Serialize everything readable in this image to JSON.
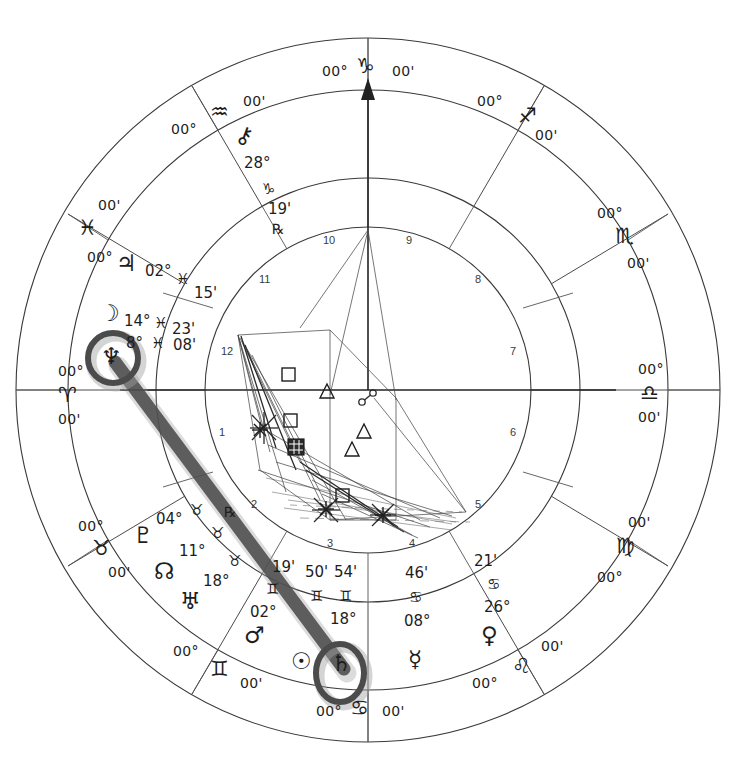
{
  "chart": {
    "type": "astrological-natal-wheel",
    "width": 737,
    "height": 770,
    "center": {
      "x": 368,
      "y": 390
    },
    "radii": {
      "outer_ring_outer": 352,
      "outer_ring_inner": 300,
      "sign_band_inner": 212,
      "house_ring_outer": 212,
      "house_ring_inner": 163,
      "aspect_circle": 163
    },
    "colors": {
      "line": "#3a3a3a",
      "text": "#1d1d1d",
      "highlight": "#4b4b4b",
      "highlight_shadow": "#9a9a9a",
      "background": "#ffffff"
    }
  },
  "angles": {
    "ascendant": {
      "label": "Ascendant",
      "degree": "00°",
      "sign": "♈",
      "sign_name": "Aries",
      "minute": "00'"
    },
    "midheaven": {
      "label": "Midheaven",
      "degree": "00°",
      "sign": "♑",
      "sign_name": "Capricorn",
      "minute": "00'"
    },
    "descendant": {
      "label": "Descendant",
      "degree": "00°",
      "sign": "♎",
      "sign_name": "Libra",
      "minute": "00'"
    },
    "imum_coeli": {
      "label": "Imum Coeli",
      "degree": "00°",
      "sign": "♋",
      "sign_name": "Cancer",
      "minute": "00'"
    }
  },
  "sign_cusps": [
    {
      "name": "Aries",
      "glyph": "♈",
      "degree": "00°",
      "minute": "00'",
      "x": 66,
      "y": 372,
      "glyph_x": 62,
      "glyph_y": 390,
      "min_x": 64,
      "min_y": 412,
      "rot": 0
    },
    {
      "name": "Taurus",
      "glyph": "♉",
      "degree": "00°",
      "minute": "00'",
      "x": 83,
      "y": 524,
      "glyph_x": 96,
      "glyph_y": 547,
      "min_x": 110,
      "min_y": 572,
      "rot": -30
    },
    {
      "name": "Gemini",
      "glyph": "♊",
      "degree": "00°",
      "minute": "00'",
      "x": 180,
      "y": 650,
      "glyph_x": 215,
      "glyph_y": 668,
      "min_x": 243,
      "min_y": 682,
      "rot": -60
    },
    {
      "name": "Cancer",
      "glyph": "♋",
      "degree": "00°",
      "minute": "00'",
      "x": 322,
      "y": 712,
      "glyph_x": 358,
      "glyph_y": 710,
      "min_x": 388,
      "min_y": 712,
      "rot": 0
    },
    {
      "name": "Leo",
      "glyph": "♌",
      "degree": "00°",
      "minute": "00'",
      "x": 480,
      "y": 684,
      "glyph_x": 520,
      "glyph_y": 668,
      "min_x": 545,
      "min_y": 645,
      "rot": 60
    },
    {
      "name": "Virgo",
      "glyph": "♍",
      "degree": "00°",
      "minute": "00'",
      "x": 604,
      "y": 578,
      "glyph_x": 622,
      "glyph_y": 545,
      "min_x": 633,
      "min_y": 522,
      "rot": 30
    },
    {
      "name": "Libra",
      "glyph": "♎",
      "degree": "00°",
      "minute": "00'",
      "x": 645,
      "y": 370,
      "glyph_x": 648,
      "glyph_y": 392,
      "min_x": 645,
      "min_y": 414,
      "rot": 0
    },
    {
      "name": "Scorpio",
      "glyph": "♏",
      "degree": "00°",
      "minute": "00'",
      "x": 604,
      "y": 212,
      "glyph_x": 622,
      "glyph_y": 236,
      "min_x": 632,
      "min_y": 262,
      "rot": -30
    },
    {
      "name": "Sagittarius",
      "glyph": "♐",
      "degree": "00°",
      "minute": "00'",
      "x": 484,
      "y": 100,
      "glyph_x": 524,
      "glyph_y": 118,
      "min_x": 540,
      "min_y": 134,
      "rot": -60
    },
    {
      "name": "Capricorn",
      "glyph": "♑",
      "degree": "00°",
      "minute": "00'",
      "x": 328,
      "y": 72,
      "glyph_x": 364,
      "glyph_y": 68,
      "min_x": 398,
      "min_y": 72,
      "rot": 0
    },
    {
      "name": "Aquarius",
      "glyph": "♒",
      "degree": "00°",
      "minute": "00'",
      "x": 178,
      "y": 128,
      "glyph_x": 218,
      "glyph_y": 113,
      "min_x": 248,
      "min_y": 100,
      "rot": 60
    },
    {
      "name": "Pisces",
      "glyph": "♓",
      "degree": "00°",
      "minute": "00'",
      "x": 94,
      "y": 256,
      "glyph_x": 84,
      "glyph_y": 228,
      "min_x": 104,
      "min_y": 205,
      "rot": 30
    }
  ],
  "houses": [
    {
      "num": "1",
      "x": 222,
      "y": 432
    },
    {
      "num": "2",
      "x": 254,
      "y": 504
    },
    {
      "num": "3",
      "x": 330,
      "y": 543
    },
    {
      "num": "4",
      "x": 412,
      "y": 543
    },
    {
      "num": "5",
      "x": 478,
      "y": 504
    },
    {
      "num": "6",
      "x": 513,
      "y": 432
    },
    {
      "num": "7",
      "x": 513,
      "y": 351
    },
    {
      "num": "8",
      "x": 478,
      "y": 279
    },
    {
      "num": "9",
      "x": 409,
      "y": 240
    },
    {
      "num": "10",
      "x": 328,
      "y": 240
    },
    {
      "num": "11",
      "x": 262,
      "y": 279
    },
    {
      "num": "12",
      "x": 224,
      "y": 351
    }
  ],
  "planets": [
    {
      "id": "chiron",
      "name": "Chiron",
      "glyph": "⚷",
      "degree": "28°",
      "sign": "♑",
      "sign_name": "Capricorn",
      "minute": "19'",
      "retrograde": "℞",
      "glyph_x": 241,
      "glyph_y": 133,
      "deg_x": 248,
      "deg_y": 162,
      "sign_x": 266,
      "sign_y": 188,
      "min_x": 272,
      "min_y": 208,
      "rx_x": 276,
      "rx_y": 228,
      "highlighted": false
    },
    {
      "id": "jupiter",
      "name": "Jupiter",
      "glyph": "♃",
      "degree": "02°",
      "sign": "♓",
      "sign_name": "Pisces",
      "minute": "15'",
      "retrograde": "",
      "glyph_x": 122,
      "glyph_y": 262,
      "deg_x": 150,
      "deg_y": 272,
      "sign_x": 182,
      "sign_y": 281,
      "min_x": 196,
      "min_y": 293,
      "rx_x": 0,
      "rx_y": 0,
      "highlighted": false
    },
    {
      "id": "moon",
      "name": "Moon",
      "glyph": "☽",
      "degree": "14°",
      "sign": "♓",
      "sign_name": "Pisces",
      "minute": "23'",
      "retrograde": "",
      "glyph_x": 104,
      "glyph_y": 310,
      "deg_x": 129,
      "deg_y": 322,
      "sign_x": 158,
      "sign_y": 324,
      "min_x": 175,
      "min_y": 330,
      "rx_x": 0,
      "rx_y": 0,
      "highlighted": false
    },
    {
      "id": "neptune",
      "name": "Neptune",
      "glyph": "♆",
      "degree": "8°",
      "sign": "♓",
      "sign_name": "Pisces",
      "minute": "08'",
      "retrograde": "",
      "glyph_x": 96,
      "glyph_y": 343,
      "deg_x": 130,
      "deg_y": 342,
      "sign_x": 155,
      "sign_y": 344,
      "min_x": 176,
      "min_y": 345,
      "rx_x": 0,
      "rx_y": 0,
      "highlighted": true
    },
    {
      "id": "pluto",
      "name": "Pluto",
      "glyph": "♇",
      "degree": "04°",
      "sign": "♉",
      "sign_name": "Taurus",
      "minute": "",
      "retrograde": "",
      "glyph_x": 139,
      "glyph_y": 534,
      "deg_x": 160,
      "deg_y": 520,
      "sign_x": 194,
      "sign_y": 512,
      "min_x": 0,
      "min_y": 0,
      "rx_x": 0,
      "rx_y": 0,
      "highlighted": false
    },
    {
      "id": "north-node",
      "name": "North Node",
      "glyph": "☊",
      "degree": "11°",
      "sign": "♉",
      "sign_name": "Taurus",
      "minute": "",
      "retrograde": "℞",
      "glyph_x": 160,
      "glyph_y": 570,
      "deg_x": 183,
      "deg_y": 552,
      "sign_x": 214,
      "sign_y": 535,
      "min_x": 0,
      "min_y": 0,
      "rx_x": 228,
      "rx_y": 513,
      "highlighted": false
    },
    {
      "id": "uranus",
      "name": "Uranus",
      "glyph": "♅",
      "degree": "18°",
      "sign": "♉",
      "sign_name": "Taurus",
      "minute": "",
      "retrograde": "",
      "glyph_x": 186,
      "glyph_y": 600,
      "deg_x": 207,
      "deg_y": 582,
      "sign_x": 231,
      "sign_y": 563,
      "min_x": 0,
      "min_y": 0,
      "rx_x": 0,
      "rx_y": 0,
      "highlighted": false
    },
    {
      "id": "mars",
      "name": "Mars",
      "glyph": "♂",
      "degree": "02°",
      "sign": "♊",
      "sign_name": "Gemini",
      "minute": "19'",
      "retrograde": "",
      "glyph_x": 250,
      "glyph_y": 634,
      "deg_x": 254,
      "deg_y": 613,
      "sign_x": 268,
      "sign_y": 591,
      "min_x": 276,
      "min_y": 568,
      "rx_x": 0,
      "rx_y": 0,
      "highlighted": false
    },
    {
      "id": "sun",
      "name": "Sun",
      "glyph": "☉",
      "degree": "",
      "sign": "♊",
      "sign_name": "Gemini",
      "minute": "50'",
      "retrograde": "",
      "glyph_x": 298,
      "glyph_y": 660,
      "deg_x": 305,
      "deg_y": 620,
      "sign_x": 314,
      "sign_y": 597,
      "min_x": 311,
      "min_y": 573,
      "rx_x": 0,
      "rx_y": 0,
      "highlighted": false
    },
    {
      "id": "saturn",
      "name": "Saturn",
      "glyph": "♄",
      "degree": "18°",
      "sign": "♊",
      "sign_name": "Gemini",
      "minute": "54'",
      "retrograde": "",
      "glyph_x": 337,
      "glyph_y": 662,
      "deg_x": 336,
      "deg_y": 620,
      "sign_x": 343,
      "sign_y": 597,
      "min_x": 340,
      "min_y": 573,
      "rx_x": 0,
      "rx_y": 0,
      "highlighted": true
    },
    {
      "id": "mercury",
      "name": "Mercury",
      "glyph": "☿",
      "degree": "08°",
      "sign": "♋",
      "sign_name": "Cancer",
      "minute": "46'",
      "retrograde": "",
      "glyph_x": 414,
      "glyph_y": 658,
      "deg_x": 409,
      "deg_y": 622,
      "sign_x": 414,
      "sign_y": 598,
      "min_x": 409,
      "min_y": 574,
      "rx_x": 0,
      "rx_y": 0,
      "highlighted": false
    },
    {
      "id": "venus",
      "name": "Venus",
      "glyph": "♀",
      "degree": "26°",
      "sign": "♋",
      "sign_name": "Cancer",
      "minute": "21'",
      "retrograde": "",
      "glyph_x": 487,
      "glyph_y": 634,
      "deg_x": 489,
      "deg_y": 608,
      "sign_x": 491,
      "sign_y": 585,
      "min_x": 478,
      "min_y": 562,
      "rx_x": 0,
      "rx_y": 0,
      "highlighted": false
    }
  ],
  "highlights": {
    "circled_planets": [
      "Neptune",
      "Saturn"
    ],
    "connector": {
      "label": "Neptune-Saturn opposition marker",
      "from": {
        "x": 113,
        "y": 360
      },
      "to": {
        "x": 342,
        "y": 667
      }
    },
    "rings": [
      {
        "label": "neptune-highlight-ring",
        "cx": 113,
        "cy": 358,
        "r": 25
      },
      {
        "label": "saturn-highlight-ring",
        "cx": 340,
        "cy": 673,
        "rx": 24,
        "ry": 29
      }
    ]
  },
  "aspect_glyphs": [
    {
      "type": "square",
      "symbol": "□",
      "x": 288,
      "y": 374
    },
    {
      "type": "trine",
      "symbol": "△",
      "x": 327,
      "y": 392
    },
    {
      "type": "square",
      "symbol": "□",
      "x": 290,
      "y": 420
    },
    {
      "type": "trine",
      "symbol": "△",
      "x": 364,
      "y": 432
    },
    {
      "type": "conjunction",
      "symbol": "▣",
      "x": 296,
      "y": 446
    },
    {
      "type": "trine",
      "symbol": "△",
      "x": 352,
      "y": 450
    },
    {
      "type": "square",
      "symbol": "□",
      "x": 342,
      "y": 495
    },
    {
      "type": "opposition",
      "symbol": "☍",
      "x": 367,
      "y": 398
    },
    {
      "type": "sextile",
      "symbol": "✳",
      "x": 260,
      "y": 430
    },
    {
      "type": "sextile",
      "symbol": "✳",
      "x": 326,
      "y": 509
    },
    {
      "type": "sextile",
      "symbol": "✳",
      "x": 383,
      "y": 515
    }
  ],
  "legend": {
    "aspect_names": {
      "square": "Square",
      "trine": "Trine",
      "sextile": "Sextile",
      "opposition": "Opposition",
      "conjunction": "Conjunction"
    }
  }
}
